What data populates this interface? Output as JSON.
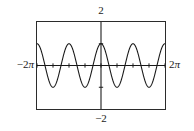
{
  "figure": {
    "kind": "graphing-calculator-window",
    "background_color": "#ffffff",
    "frame_color": "#2b2b2b",
    "curve_color": "#1a1a1a",
    "axis_color": "#1a1a1a"
  },
  "labels": {
    "y_max": "2",
    "y_min": "−2",
    "x_min_number": "−2",
    "x_min_unit": "π",
    "x_max_number": "2",
    "x_max_unit": "π"
  },
  "chart_data": {
    "type": "line",
    "title": "",
    "subtitle": "",
    "xlabel": "",
    "ylabel": "",
    "grid": false,
    "legend": false,
    "legend_position": "none",
    "xlim": [
      -6.283185307179586,
      6.283185307179586
    ],
    "ylim": [
      -2,
      2
    ],
    "xlim_labels": [
      "−2π",
      "2π"
    ],
    "ylim_labels": [
      "−2",
      "2"
    ],
    "x_tick_interval": 1.5707963267948966,
    "x_tick_values": [
      -6.283185307179586,
      -4.71238898038469,
      -3.141592653589793,
      -1.5707963267948966,
      0,
      1.5707963267948966,
      3.141592653589793,
      4.71238898038469,
      6.283185307179586
    ],
    "y_tick_values": [
      -1,
      1
    ],
    "tick_labels_shown": false,
    "series": [
      {
        "name": "y = cos(2x)",
        "amplitude": 1,
        "period": 3.141592653589793,
        "cycles_in_view": 4,
        "phase": 0,
        "x": [
          -6.283185307179586,
          -6.086835766330224,
          -5.890486225480862,
          -5.6941366846315,
          -5.497787143782138,
          -5.301437602932776,
          -5.105088062083414,
          -4.908738521234052,
          -4.71238898038469,
          -4.516039439535327,
          -4.319689898685965,
          -4.123340357836604,
          -3.9269908169872414,
          -3.730641276137879,
          -3.5342917352885173,
          -3.337942194439155,
          -3.141592653589793,
          -2.945243112740431,
          -2.748893571891069,
          -2.552544031041707,
          -2.356194490192345,
          -2.1598449493429825,
          -1.9634954084936207,
          -1.7671458676442586,
          -1.5707963267948966,
          -1.3744467859455345,
          -1.1780972450961724,
          -0.9817477042468103,
          -0.7853981633974483,
          -0.5890486225480862,
          -0.39269908169872414,
          -0.19634954084936207,
          0,
          0.19634954084936207,
          0.39269908169872414,
          0.5890486225480862,
          0.7853981633974483,
          0.9817477042468103,
          1.1780972450961724,
          1.3744467859455345,
          1.5707963267948966,
          1.7671458676442586,
          1.9634954084936207,
          2.1598449493429825,
          2.356194490192345,
          2.552544031041707,
          2.748893571891069,
          2.945243112740431,
          3.141592653589793,
          3.337942194439155,
          3.5342917352885173,
          3.730641276137879,
          3.9269908169872414,
          4.123340357836604,
          4.319689898685965,
          4.516039439535327,
          4.71238898038469,
          4.908738521234052,
          5.105088062083414,
          5.301437602932776,
          5.497787143782138,
          5.6941366846315,
          5.890486225480862,
          6.086835766330224,
          6.283185307179586
        ],
        "y": [
          1,
          0.9238795325112867,
          0.7071067811865476,
          0.3826834323650898,
          0,
          -0.3826834323650898,
          -0.7071067811865476,
          -0.9238795325112867,
          -1,
          -0.9238795325112867,
          -0.7071067811865476,
          -0.3826834323650898,
          0,
          0.3826834323650898,
          0.7071067811865476,
          0.9238795325112867,
          1,
          0.9238795325112867,
          0.7071067811865476,
          0.3826834323650898,
          0,
          -0.3826834323650898,
          -0.7071067811865476,
          -0.9238795325112867,
          -1,
          -0.9238795325112867,
          -0.7071067811865476,
          -0.3826834323650898,
          0,
          0.3826834323650898,
          0.7071067811865476,
          0.9238795325112867,
          1,
          0.9238795325112867,
          0.7071067811865476,
          0.3826834323650898,
          0,
          -0.3826834323650898,
          -0.7071067811865476,
          -0.9238795325112867,
          -1,
          -0.9238795325112867,
          -0.7071067811865476,
          -0.3826834323650898,
          0,
          0.3826834323650898,
          0.7071067811865476,
          0.9238795325112867,
          1,
          0.9238795325112867,
          0.7071067811865476,
          0.3826834323650898,
          0,
          -0.3826834323650898,
          -0.7071067811865476,
          -0.9238795325112867,
          -1,
          -0.9238795325112867,
          -0.7071067811865476,
          -0.3826834323650898,
          0,
          0.3826834323650898,
          0.7071067811865476,
          0.9238795325112867,
          1
        ]
      }
    ]
  }
}
